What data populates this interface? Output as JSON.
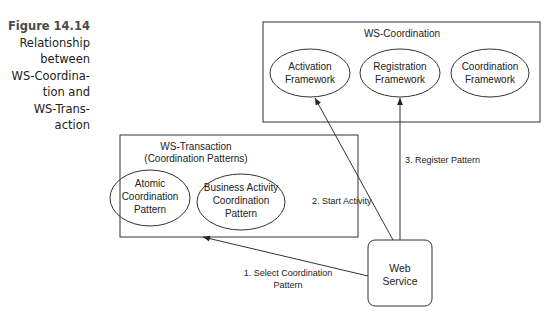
{
  "caption": {
    "figure_label": "Figure 14.14",
    "lines": [
      "Relationship",
      "between",
      "WS-Coordina-",
      "tion and",
      "WS-Trans-",
      "action"
    ]
  },
  "ws_coordination": {
    "title": "WS-Coordination",
    "ellipses": [
      {
        "line1": "Activation",
        "line2": "Framework"
      },
      {
        "line1": "Registration",
        "line2": "Framework"
      },
      {
        "line1": "Coordination",
        "line2": "Framework"
      }
    ]
  },
  "ws_transaction": {
    "title": "WS-Transaction",
    "subtitle": "(Coordination Patterns)",
    "ellipses": [
      {
        "line1": "Atomic",
        "line2": "Coordination",
        "line3": "Pattern"
      },
      {
        "line1": "Business Activity",
        "line2": "Coordination",
        "line3": "Pattern"
      }
    ]
  },
  "web_service": {
    "line1": "Web",
    "line2": "Service"
  },
  "arrows": [
    {
      "label_line1": "1. Select Coordination",
      "label_line2": "Pattern"
    },
    {
      "label": "2. Start Activity"
    },
    {
      "label": "3. Register Pattern"
    }
  ],
  "colors": {
    "stroke": "#333333",
    "text": "#222222",
    "caption_title": "#4a4a4a"
  }
}
